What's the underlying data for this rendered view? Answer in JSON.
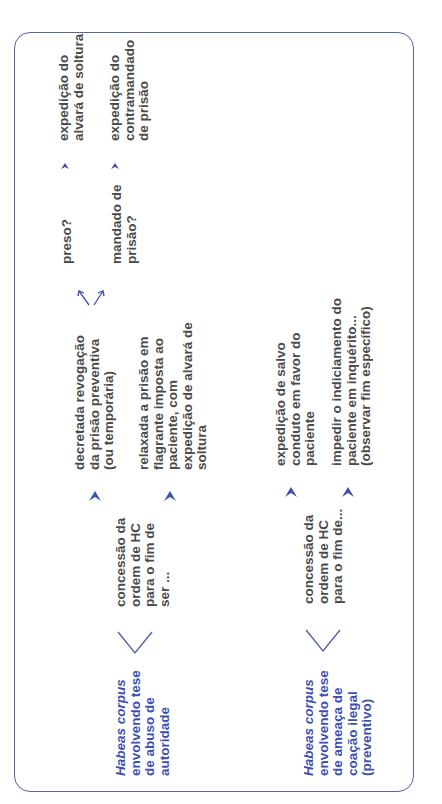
{
  "diagram": {
    "border_color": "#5560a8",
    "accent_color": "#3c4fb4",
    "text_color": "#4a4a4a",
    "branches": [
      {
        "id": "abuso",
        "root": {
          "italic": "Habeas corpus",
          "rest": "\nenvolvendo tese\nde abuso de\nautoridade"
        },
        "connector": "concessão da\nordem de HC\npara o fim de\nser ...",
        "outcomes": [
          {
            "text": "decretada revogação\nda prisão preventiva\n(ou temporária)",
            "sub_branches": [
              {
                "question": "preso?",
                "result": "expedição do\nalvará de soltura"
              },
              {
                "question": "mandado de\nprisão?",
                "result": "expedição do\ncontramandado\nde prisão"
              }
            ]
          },
          {
            "text": "relaxada a prisão em\nflagrante imposta ao\npaciente, com\nexpedição de alvará de\nsoltura"
          }
        ]
      },
      {
        "id": "preventivo",
        "root": {
          "italic": "Habeas corpus",
          "rest": "\nenvolvendo tese\nde ameaça de\ncoação ilegal\n(preventivo)"
        },
        "connector": "concessão da\nordem de HC\npara o fim de...",
        "outcomes": [
          {
            "text": "expedição de salvo\nconduto em favor do\npaciente"
          },
          {
            "text": "impedir o indiciamento do\npaciente em inquérito...\n(observar fim específico)"
          }
        ]
      }
    ]
  }
}
